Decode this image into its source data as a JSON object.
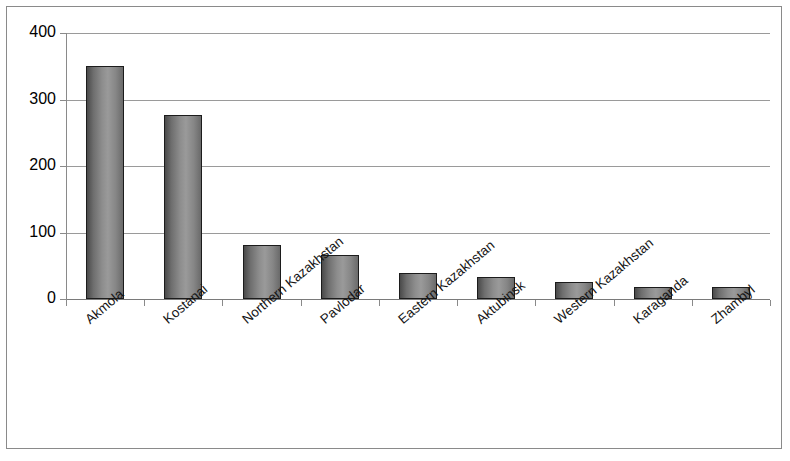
{
  "chart_data": {
    "type": "bar",
    "title": "",
    "subtitle": "",
    "xlabel": "",
    "ylabel": "",
    "ylim": [
      0,
      400
    ],
    "ytick_labels": [
      "0",
      "100",
      "200",
      "300",
      "400"
    ],
    "ytick_values": [
      0,
      100,
      200,
      300,
      400
    ],
    "grid": true,
    "legend": null,
    "categories": [
      "Akmola",
      "Kostanai",
      "Northern Kazakhstan",
      "Pavlodar",
      "Eastern Kazakhstan",
      "Aktubinsk",
      "Western Kazakhstan",
      "Karaganda",
      "Zhambyl"
    ],
    "values": [
      350,
      277,
      81,
      66,
      39,
      33,
      26,
      18,
      18
    ],
    "bar_color": "#8d8d8d",
    "bar_border_color": "#1c1c1c",
    "gridline_color": "#9a9a9a",
    "axis_color": "#8a8a8a",
    "frame_border_color": "#8a8a8a",
    "background_color": "#ffffff",
    "label_rotation_degrees": -40
  }
}
